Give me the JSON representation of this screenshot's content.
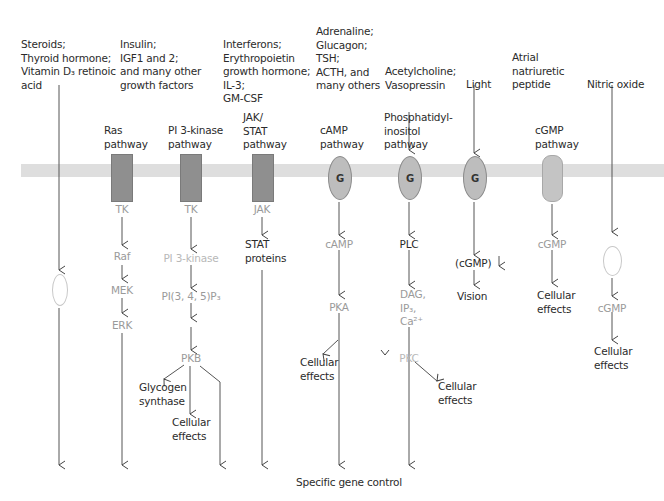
{
  "diagram": {
    "membrane_color": "#dedede",
    "bottom_label": "Specific gene control",
    "columns": [
      {
        "id": "steroids",
        "signal": "Steroids;\nThyroid hormone;\nVitamin D₃ retinoic\nacid",
        "pathway": "",
        "receptor": "intracellular-receptor-oval",
        "steps": []
      },
      {
        "id": "ras",
        "signal": "Insulin;\nIGF1 and 2;\nand many other\ngrowth factors",
        "pathway": "Ras\npathway",
        "receptor": "TK",
        "steps": [
          "Raf",
          "MEK",
          "ERK"
        ]
      },
      {
        "id": "pi3k",
        "signal": "",
        "pathway": "PI 3-kinase\npathway",
        "receptor": "TK",
        "steps": [
          "PI 3-kinase",
          "PI(3, 4, 5)P₃",
          "PKB"
        ],
        "branches": [
          "Glycogen\nsynthase",
          "Cellular\neffects"
        ]
      },
      {
        "id": "jakstat",
        "signal": "Interferons;\nErythropoietin\ngrowth hormone;\nIL-3;\nGM-CSF",
        "pathway": "JAK/\nSTAT\npathway",
        "receptor": "JAK",
        "steps": [
          "STAT\nproteins"
        ]
      },
      {
        "id": "camp",
        "signal": "Adrenaline;\nGlucagon;\nTSH;\nACTH, and\nmany others",
        "pathway": "cAMP\npathway",
        "receptor": "G",
        "steps": [
          "cAMP",
          "PKA"
        ],
        "branches": [
          "Cellular\neffects"
        ]
      },
      {
        "id": "pi",
        "signal": "Acetylcholine;\nVasopressin",
        "pathway": "Phosphatidyl-\ninositol\npathway",
        "receptor": "G",
        "steps": [
          "PLC",
          "DAG,\nIP₃,\nCa²⁺",
          "PKC"
        ],
        "branches": [
          "Cellular\neffects"
        ]
      },
      {
        "id": "light",
        "signal": "Light",
        "pathway": "",
        "receptor": "G",
        "steps": [
          "(cGMP) ↓",
          "Vision"
        ]
      },
      {
        "id": "cgmp",
        "signal": "Atrial\nnatriuretic\npeptide",
        "pathway": "cGMP\npathway",
        "receptor": "guanylyl-cyclase",
        "steps": [
          "cGMP",
          "Cellular\neffects"
        ]
      },
      {
        "id": "no",
        "signal": "Nitric oxide",
        "pathway": "",
        "receptor": "soluble-guanylyl-cyclase-oval",
        "steps": [
          "cGMP",
          "Cellular\neffects"
        ]
      }
    ]
  },
  "labels": {
    "sig_steroids": "Steroids;\nThyroid hormone;\nVitamin D₃ retinoic\nacid",
    "sig_insulin": "Insulin;\nIGF1 and 2;\nand many other\ngrowth factors",
    "sig_interferons": "Interferons;\nErythropoietin\ngrowth hormone;\nIL-3;\nGM-CSF",
    "sig_adrenaline": "Adrenaline;\nGlucagon;\nTSH;\nACTH, and\nmany others",
    "sig_acetylcholine": "Acetylcholine;\nVasopressin",
    "sig_light": "Light",
    "sig_anp": "Atrial\nnatriuretic\npeptide",
    "sig_no": "Nitric oxide",
    "pw_ras": "Ras\npathway",
    "pw_pi3k": "PI 3-kinase\npathway",
    "pw_jak": "JAK/\nSTAT\npathway",
    "pw_camp": "cAMP\npathway",
    "pw_pi": "Phosphatidyl-\ninositol\npathway",
    "pw_cgmp": "cGMP\npathway",
    "tk1": "TK",
    "tk2": "TK",
    "jak": "JAK",
    "g": "G",
    "raf": "Raf",
    "mek": "MEK",
    "erk": "ERK",
    "pi3k": "PI 3-kinase",
    "pip3": "PI(3, 4, 5)P₃",
    "pkb": "PKB",
    "glycogen": "Glycogen\nsynthase",
    "cell_eff": "Cellular\neffects",
    "stat": "STAT\nproteins",
    "camp": "cAMP",
    "pka": "PKA",
    "plc": "PLC",
    "dag": "DAG,\nIP₃,\nCa²⁺",
    "pkc": "PKC",
    "cgmp_light": "(cGMP)",
    "vision": "Vision",
    "cgmp": "cGMP",
    "gene": "Specific gene control"
  }
}
